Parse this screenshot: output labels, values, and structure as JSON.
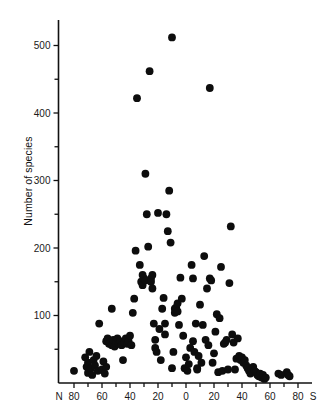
{
  "chart_data": {
    "type": "scatter",
    "title": "",
    "xlabel": "",
    "ylabel": "Number of species",
    "x_axis": {
      "left_cap": "N",
      "right_cap": "S",
      "tick_labels": [
        "80",
        "60",
        "40",
        "20",
        "0",
        "20",
        "40",
        "60",
        "80"
      ],
      "tick_values": [
        -80,
        -60,
        -40,
        -20,
        0,
        20,
        40,
        60,
        80
      ],
      "minor_tick_step": 10,
      "xlim": [
        -85,
        85
      ],
      "description": "Latitude, degrees North (left) to degrees South (right)"
    },
    "y_axis": {
      "tick_labels": [
        "100",
        "200",
        "300",
        "400",
        "500"
      ],
      "tick_values": [
        100,
        200,
        300,
        400,
        500
      ],
      "minor_tick_step": 50,
      "ylim": [
        0,
        560
      ]
    },
    "grid": false,
    "legend": "none",
    "marker": {
      "shape": "circle",
      "color": "#0d0d0d",
      "size": 5.2
    },
    "points": [
      [
        -80,
        18
      ],
      [
        -72,
        38
      ],
      [
        -71,
        24
      ],
      [
        -70,
        15
      ],
      [
        -70,
        30
      ],
      [
        -69,
        46
      ],
      [
        -68,
        22
      ],
      [
        -67,
        12
      ],
      [
        -66,
        34
      ],
      [
        -65,
        26
      ],
      [
        -64,
        40
      ],
      [
        -63,
        18
      ],
      [
        -62,
        88
      ],
      [
        -60,
        20
      ],
      [
        -59,
        32
      ],
      [
        -58,
        14
      ],
      [
        -57,
        24
      ],
      [
        -57,
        62
      ],
      [
        -56,
        66
      ],
      [
        -55,
        58
      ],
      [
        -54,
        60
      ],
      [
        -53,
        56
      ],
      [
        -53,
        110
      ],
      [
        -52,
        64
      ],
      [
        -51,
        54
      ],
      [
        -50,
        60
      ],
      [
        -49,
        66
      ],
      [
        -48,
        58
      ],
      [
        -47,
        62
      ],
      [
        -46,
        56
      ],
      [
        -45,
        34
      ],
      [
        -44,
        60
      ],
      [
        -43,
        66
      ],
      [
        -42,
        58
      ],
      [
        -41,
        62
      ],
      [
        -40,
        70
      ],
      [
        -39,
        56
      ],
      [
        -38,
        104
      ],
      [
        -37,
        125
      ],
      [
        -36,
        196
      ],
      [
        -35,
        422
      ],
      [
        -33,
        175
      ],
      [
        -32,
        150
      ],
      [
        -31,
        145
      ],
      [
        -31,
        160
      ],
      [
        -30,
        155
      ],
      [
        -29,
        152
      ],
      [
        -29,
        310
      ],
      [
        -28,
        250
      ],
      [
        -27,
        202
      ],
      [
        -26,
        462
      ],
      [
        -25,
        155
      ],
      [
        -25,
        150
      ],
      [
        -24,
        140
      ],
      [
        -24,
        160
      ],
      [
        -23,
        88
      ],
      [
        -22,
        64
      ],
      [
        -22,
        52
      ],
      [
        -21,
        46
      ],
      [
        -20,
        252
      ],
      [
        -19,
        80
      ],
      [
        -18,
        34
      ],
      [
        -17,
        110
      ],
      [
        -16,
        126
      ],
      [
        -15,
        72
      ],
      [
        -15,
        88
      ],
      [
        -14,
        250
      ],
      [
        -13,
        225
      ],
      [
        -12,
        285
      ],
      [
        -11,
        208
      ],
      [
        -10,
        512
      ],
      [
        -10,
        22
      ],
      [
        -9,
        46
      ],
      [
        -8,
        110
      ],
      [
        -8,
        104
      ],
      [
        -7,
        112
      ],
      [
        -6,
        118
      ],
      [
        -6,
        106
      ],
      [
        -5,
        86
      ],
      [
        -4,
        156
      ],
      [
        -3,
        125
      ],
      [
        -2,
        70
      ],
      [
        -1,
        22
      ],
      [
        0,
        38
      ],
      [
        1,
        18
      ],
      [
        2,
        28
      ],
      [
        3,
        52
      ],
      [
        4,
        175
      ],
      [
        5,
        62
      ],
      [
        5,
        155
      ],
      [
        6,
        46
      ],
      [
        7,
        88
      ],
      [
        8,
        22
      ],
      [
        8,
        20
      ],
      [
        9,
        40
      ],
      [
        10,
        116
      ],
      [
        11,
        30
      ],
      [
        12,
        86
      ],
      [
        13,
        188
      ],
      [
        14,
        64
      ],
      [
        15,
        140
      ],
      [
        16,
        56
      ],
      [
        17,
        437
      ],
      [
        17,
        155
      ],
      [
        18,
        152
      ],
      [
        19,
        30
      ],
      [
        20,
        44
      ],
      [
        21,
        76
      ],
      [
        22,
        102
      ],
      [
        23,
        16
      ],
      [
        24,
        96
      ],
      [
        25,
        172
      ],
      [
        26,
        18
      ],
      [
        27,
        58
      ],
      [
        28,
        60
      ],
      [
        29,
        64
      ],
      [
        30,
        20
      ],
      [
        31,
        148
      ],
      [
        32,
        232
      ],
      [
        33,
        72
      ],
      [
        34,
        60
      ],
      [
        35,
        20
      ],
      [
        36,
        36
      ],
      [
        37,
        66
      ],
      [
        38,
        40
      ],
      [
        39,
        34
      ],
      [
        40,
        38
      ],
      [
        41,
        30
      ],
      [
        42,
        34
      ],
      [
        43,
        26
      ],
      [
        44,
        22
      ],
      [
        45,
        18
      ],
      [
        46,
        14
      ],
      [
        47,
        20
      ],
      [
        48,
        24
      ],
      [
        49,
        18
      ],
      [
        50,
        16
      ],
      [
        51,
        12
      ],
      [
        52,
        10
      ],
      [
        53,
        14
      ],
      [
        54,
        8
      ],
      [
        55,
        12
      ],
      [
        56,
        6
      ],
      [
        57,
        8
      ],
      [
        66,
        14
      ],
      [
        68,
        12
      ],
      [
        72,
        16
      ],
      [
        73,
        12
      ],
      [
        74,
        10
      ]
    ]
  }
}
